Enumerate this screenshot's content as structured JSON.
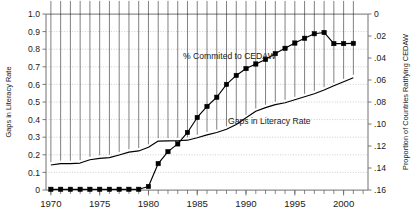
{
  "chart_data": {
    "type": "line",
    "title": "",
    "subtitle": "",
    "xlabel": "",
    "ylabel": "Gaps in Literacy Rate",
    "y2label": "Proportion of Countries Ratifying CEDAW",
    "xlim": [
      1969.5,
      2002.5
    ],
    "ylim": [
      0,
      1.0
    ],
    "y2lim": [
      0.16,
      0
    ],
    "y2_inverted": true,
    "grid": true,
    "legend": "inline-annotations",
    "x_tick_labels": [
      "1970",
      "1975",
      "1980",
      "1985",
      "1990",
      "1995",
      "2000"
    ],
    "x_tick_values": [
      1970,
      1975,
      1980,
      1985,
      1990,
      1995,
      2000
    ],
    "x_minor_ticks": [
      1970,
      1971,
      1972,
      1973,
      1974,
      1975,
      1976,
      1977,
      1978,
      1979,
      1980,
      1981,
      1982,
      1983,
      1984,
      1985,
      1986,
      1987,
      1988,
      1989,
      1990,
      1991,
      1992,
      1993,
      1994,
      1995,
      1996,
      1997,
      1998,
      1999,
      2000,
      2001,
      2002
    ],
    "y_tick_labels": [
      "1.0",
      "0.9",
      "0.8",
      "0.7",
      "0.6",
      "0.5",
      "0.4",
      "0.3",
      "0.2",
      "0.1",
      "0"
    ],
    "y_tick_values": [
      1.0,
      0.9,
      0.8,
      0.7,
      0.6,
      0.5,
      0.4,
      0.3,
      0.2,
      0.1,
      0
    ],
    "y2_tick_labels": [
      "0",
      ".02",
      ".04",
      ".06",
      ".08",
      ".10",
      ".12",
      ".14",
      ".16"
    ],
    "y2_tick_values": [
      0,
      0.02,
      0.04,
      0.06,
      0.08,
      0.1,
      0.12,
      0.14,
      0.16
    ],
    "x": [
      1970,
      1971,
      1972,
      1973,
      1974,
      1975,
      1976,
      1977,
      1978,
      1979,
      1980,
      1981,
      1982,
      1983,
      1984,
      1985,
      1986,
      1987,
      1988,
      1989,
      1990,
      1991,
      1992,
      1993,
      1994,
      1995,
      1996,
      1997,
      1998,
      1999,
      2000,
      2001
    ],
    "series": [
      {
        "name": "Gaps in Literacy Rate",
        "axis": "left",
        "marker": "diamond",
        "annotation": "Gaps in Literacy Rate",
        "values": [
          0.142,
          0.15,
          0.15,
          0.153,
          0.172,
          0.18,
          0.184,
          0.199,
          0.215,
          0.222,
          0.243,
          0.278,
          0.279,
          0.28,
          0.283,
          0.297,
          0.313,
          0.327,
          0.345,
          0.372,
          0.41,
          0.447,
          0.468,
          0.485,
          0.496,
          0.513,
          0.53,
          0.547,
          0.568,
          0.592,
          0.615,
          0.638
        ]
      },
      {
        "name": "% Commited to CEDAW",
        "axis": "left",
        "marker": "square",
        "annotation": "% Commited to CEDAW",
        "values": [
          0.004,
          0.004,
          0.004,
          0.004,
          0.004,
          0.004,
          0.004,
          0.004,
          0.004,
          0.004,
          0.02,
          0.15,
          0.218,
          0.262,
          0.327,
          0.412,
          0.475,
          0.527,
          0.6,
          0.651,
          0.69,
          0.716,
          0.742,
          0.775,
          0.805,
          0.835,
          0.862,
          0.888,
          0.895,
          0.832,
          0.832,
          0.833
        ]
      }
    ],
    "annotations": [
      {
        "text": "% Commited to CEDAW",
        "x_px": 183,
        "y_px": 59
      },
      {
        "text": "Gaps in Literacy Rate",
        "x_px": 228,
        "y_px": 124
      }
    ]
  },
  "colors": {
    "series": "#000000",
    "grid": "#b9b9b9",
    "spine": "#8d8d8d",
    "text": "#1a1a1a",
    "background": "#ffffff"
  }
}
